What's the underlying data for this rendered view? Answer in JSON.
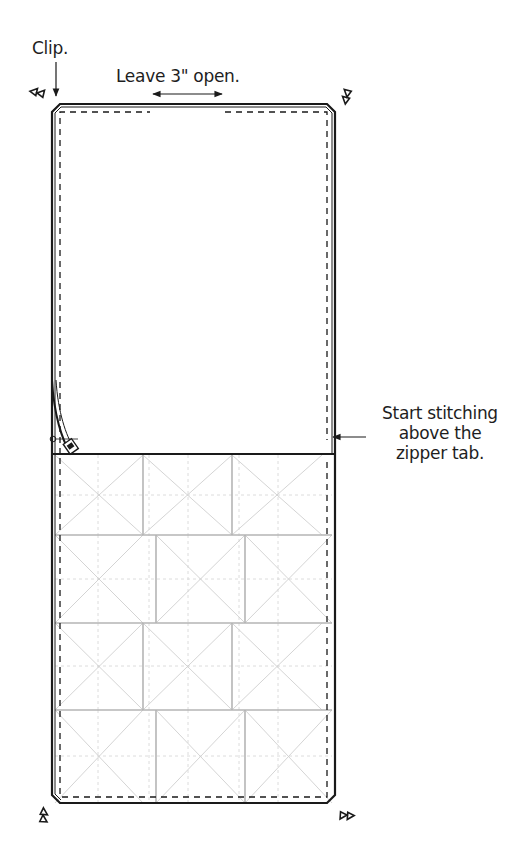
{
  "diagram": {
    "labels": {
      "clip": "Clip.",
      "leave_open": "Leave 3\" open.",
      "start_stitching": [
        "Start stitching",
        "above the",
        "zipper tab."
      ]
    },
    "panels": {
      "upper": "Plain lining panel",
      "lower": "Quilted patchwork panel"
    },
    "lower_panel": {
      "rows": 4,
      "blocks_per_row": 3,
      "pattern": "offset hourglass blocks with diagonal quilting"
    },
    "markers": [
      "clip-mark-top-left",
      "clip-mark-top-right",
      "clip-mark-bottom-left",
      "clip-mark-bottom-right"
    ],
    "colors": {
      "outline": "#1a1a1a",
      "seam": "#bcbcbc",
      "quilting": "#cfcfcf"
    }
  }
}
